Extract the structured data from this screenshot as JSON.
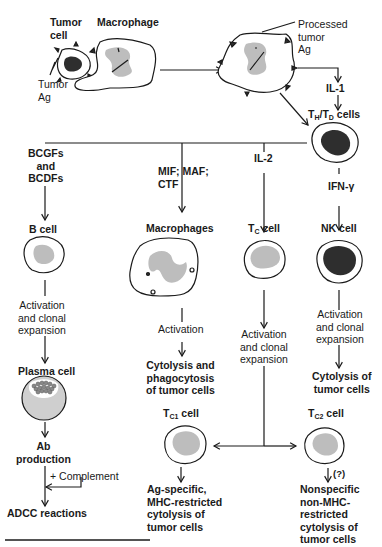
{
  "top": {
    "tumor_cell": [
      "Tumor",
      "cell"
    ],
    "macrophage": "Macrophage",
    "tumor_ag": [
      "Tumor",
      "Ag"
    ],
    "processed_ag": [
      "Processed",
      "tumor",
      "Ag"
    ],
    "il1": "IL-1",
    "th_td": {
      "t1": "T",
      "s1": "H",
      "sep": "/T",
      "s2": "D",
      "rest": " cells"
    }
  },
  "branches": {
    "b_cell": {
      "factor": [
        "BCGFs",
        "and",
        "BCDFs"
      ],
      "cell": "B cell",
      "step": [
        "Activation",
        "and clonal",
        "expansion"
      ],
      "product_cell": "Plasma cell",
      "output": [
        "Ab",
        "production"
      ],
      "complement": "+ Complement",
      "final": "ADCC reactions"
    },
    "macrophages": {
      "factor": [
        "MIF; MAF;",
        "CTF"
      ],
      "cell": "Macrophages",
      "step": "Activation",
      "output": [
        "Cytolysis and",
        "phagocytosis",
        "of tumor cells"
      ]
    },
    "tc": {
      "factor": "IL-2",
      "cell": {
        "t": "T",
        "s": "C",
        "rest": " cell"
      },
      "step": [
        "Activation",
        "and clonal",
        "expansion"
      ],
      "tc1": {
        "t": "T",
        "s": "C1",
        "rest": " cell",
        "output": [
          "Ag-specific,",
          "MHC-restricted",
          "cytolysis of",
          "tumor cells"
        ]
      },
      "tc2": {
        "t": "T",
        "s": "C2",
        "rest": " cell",
        "question": "(?)",
        "output": [
          "Nonspecific",
          "non-MHC-",
          "restricted",
          "cytolysis of",
          "tumor cells"
        ]
      }
    },
    "nk": {
      "factor": "IFN-γ",
      "cell": "NK cell",
      "step": [
        "Activation",
        "and clonal",
        "expansion"
      ],
      "output": [
        "Cytolysis of",
        "tumor cells"
      ]
    }
  },
  "colors": {
    "line": "#1a1a1a",
    "nucleus_gray": "#bdbdbd",
    "nucleus_dark": "#2e2e2e",
    "plasma_fill": "#cfcfcf"
  }
}
